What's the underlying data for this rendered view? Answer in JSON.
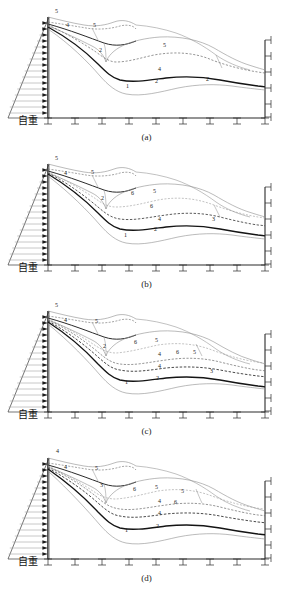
{
  "document": {
    "type": "engineering-diagram",
    "description": "Four-panel structural/geotechnical section diagram with triangular self-weight load, roller supports and labelled deformation curves",
    "width": 293,
    "height": 589,
    "background_color": "#ffffff",
    "line_color": "#2a2a2a",
    "thick_line_color": "#111111",
    "light_line_color": "#8d8d8d",
    "dashed_line_color": "#555555"
  },
  "panels": [
    {
      "id": "panel-a",
      "caption": "(a)",
      "dead_load_label": "自重",
      "arrow_count": 17,
      "base_support_count": 9,
      "wall_support_count": 5,
      "curve_labels": [
        "5",
        "4",
        "5",
        "2",
        "5",
        "4",
        "1",
        "2",
        "2"
      ]
    },
    {
      "id": "panel-b",
      "caption": "(b)",
      "dead_load_label": "自重",
      "arrow_count": 17,
      "base_support_count": 9,
      "wall_support_count": 5,
      "curve_labels": [
        "5",
        "4",
        "5",
        "2",
        "6",
        "5",
        "6",
        "4",
        "1",
        "2",
        "3"
      ]
    },
    {
      "id": "panel-c",
      "caption": "(c)",
      "dead_load_label": "自重",
      "arrow_count": 17,
      "base_support_count": 9,
      "wall_support_count": 5,
      "curve_labels": [
        "5",
        "4",
        "5",
        "2",
        "6",
        "5",
        "6",
        "5",
        "4",
        "4",
        "1",
        "2",
        "3"
      ]
    },
    {
      "id": "panel-d",
      "caption": "(d)",
      "dead_load_label": "自重",
      "arrow_count": 17,
      "base_support_count": 9,
      "wall_support_count": 5,
      "curve_labels": [
        "4",
        "4",
        "5",
        "3",
        "6",
        "5",
        "5",
        "6",
        "4",
        "4",
        "1",
        "2"
      ]
    }
  ],
  "legend_numbers": {
    "1": "1",
    "2": "2",
    "3": "3",
    "4": "4",
    "5": "5",
    "6": "6"
  }
}
